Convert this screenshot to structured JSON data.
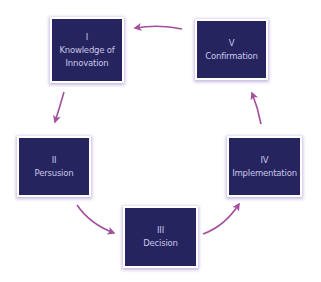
{
  "diagram": {
    "type": "cycle",
    "colors": {
      "box_fill": "#25245f",
      "box_border": "#ffffff",
      "text": "#c9c6e6",
      "arrow": "#a14f9e"
    },
    "stages": [
      {
        "numeral": "I",
        "label_line1": "Knowledge of",
        "label_line2": "Innovation"
      },
      {
        "numeral": "II",
        "label_line1": "Persusion"
      },
      {
        "numeral": "III",
        "label_line1": "Decision"
      },
      {
        "numeral": "IV",
        "label_line1": "Implementation"
      },
      {
        "numeral": "V",
        "label_line1": "Confirmation"
      }
    ],
    "connections": [
      {
        "from": "I",
        "to": "II"
      },
      {
        "from": "II",
        "to": "III"
      },
      {
        "from": "III",
        "to": "IV"
      },
      {
        "from": "IV",
        "to": "V"
      },
      {
        "from": "V",
        "to": "I"
      }
    ]
  }
}
